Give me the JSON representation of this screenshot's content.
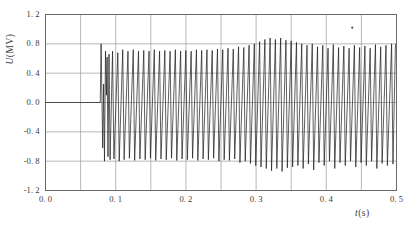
{
  "chart_data": {
    "type": "line",
    "title": "",
    "xlabel": "t(s)",
    "ylabel": "U(MV)",
    "xlabel_symbol": "t",
    "xlabel_unit": "(s)",
    "ylabel_symbol": "U",
    "ylabel_unit": "(MV)",
    "xlim": [
      0.0,
      0.5
    ],
    "ylim": [
      -1.2,
      1.2
    ],
    "xticks": [
      0.0,
      0.1,
      0.2,
      0.3,
      0.4,
      0.5
    ],
    "xticklabels": [
      "0. 0",
      "0. 1",
      "0. 2",
      "0. 3",
      "0. 4",
      "0. 5"
    ],
    "yticks": [
      1.2,
      0.8,
      0.4,
      0.0,
      -0.4,
      -0.8,
      -1.2
    ],
    "yticklabels": [
      "1. 2",
      "0. 8",
      "0. 4",
      "0. 0",
      "-0. 4",
      "-0. 8",
      "-1. 2"
    ],
    "x_minor_step": 0.05,
    "grid": true,
    "grid_color": "#9a9a9a",
    "line_color": "#1a1a1a",
    "line_width": 0.7,
    "frame_color": "#6a6a6a",
    "background": "#ffffff",
    "series": [
      {
        "name": "U(t)",
        "points": [
          [
            0.0,
            0.0
          ],
          [
            0.078,
            0.0
          ],
          [
            0.0792,
            0.8
          ],
          [
            0.0815,
            -0.62
          ],
          [
            0.0828,
            0.25
          ],
          [
            0.084,
            -0.8
          ],
          [
            0.0855,
            0.7
          ],
          [
            0.0868,
            0.1
          ],
          [
            0.0878,
            0.62
          ],
          [
            0.089,
            -0.74
          ],
          [
            0.0905,
            0.66
          ],
          [
            0.092,
            -0.78
          ],
          [
            0.0955,
            0.7
          ],
          [
            0.0975,
            -0.77
          ],
          [
            0.103,
            0.68
          ],
          [
            0.105,
            -0.8
          ],
          [
            0.11,
            0.72
          ],
          [
            0.112,
            -0.78
          ],
          [
            0.1175,
            0.7
          ],
          [
            0.1195,
            -0.76
          ],
          [
            0.125,
            0.72
          ],
          [
            0.127,
            -0.79
          ],
          [
            0.1325,
            0.7
          ],
          [
            0.1345,
            -0.77
          ],
          [
            0.14,
            0.71
          ],
          [
            0.142,
            -0.78
          ],
          [
            0.1475,
            0.7
          ],
          [
            0.1495,
            -0.76
          ],
          [
            0.155,
            0.72
          ],
          [
            0.157,
            -0.79
          ],
          [
            0.1625,
            0.7
          ],
          [
            0.1645,
            -0.77
          ],
          [
            0.17,
            0.71
          ],
          [
            0.172,
            -0.78
          ],
          [
            0.1775,
            0.7
          ],
          [
            0.1795,
            -0.76
          ],
          [
            0.185,
            0.72
          ],
          [
            0.187,
            -0.79
          ],
          [
            0.1925,
            0.7
          ],
          [
            0.1945,
            -0.77
          ],
          [
            0.2,
            0.71
          ],
          [
            0.202,
            -0.78
          ],
          [
            0.2075,
            0.7
          ],
          [
            0.2095,
            -0.76
          ],
          [
            0.215,
            0.72
          ],
          [
            0.217,
            -0.79
          ],
          [
            0.2225,
            0.71
          ],
          [
            0.2245,
            -0.77
          ],
          [
            0.23,
            0.72
          ],
          [
            0.232,
            -0.78
          ],
          [
            0.2375,
            0.71
          ],
          [
            0.2395,
            -0.76
          ],
          [
            0.245,
            0.73
          ],
          [
            0.247,
            -0.8
          ],
          [
            0.2525,
            0.72
          ],
          [
            0.2545,
            -0.78
          ],
          [
            0.26,
            0.74
          ],
          [
            0.262,
            -0.79
          ],
          [
            0.2675,
            0.73
          ],
          [
            0.2695,
            -0.77
          ],
          [
            0.275,
            0.76
          ],
          [
            0.277,
            -0.82
          ],
          [
            0.2825,
            0.75
          ],
          [
            0.2845,
            -0.8
          ],
          [
            0.29,
            0.78
          ],
          [
            0.292,
            -0.83
          ],
          [
            0.2975,
            0.8
          ],
          [
            0.2995,
            -0.86
          ],
          [
            0.305,
            0.83
          ],
          [
            0.307,
            -0.88
          ],
          [
            0.3125,
            0.86
          ],
          [
            0.3145,
            -0.9
          ],
          [
            0.32,
            0.88
          ],
          [
            0.322,
            -0.93
          ],
          [
            0.3275,
            0.86
          ],
          [
            0.3295,
            -0.9
          ],
          [
            0.335,
            0.88
          ],
          [
            0.337,
            -0.94
          ],
          [
            0.3425,
            0.85
          ],
          [
            0.3445,
            -0.89
          ],
          [
            0.35,
            0.84
          ],
          [
            0.352,
            -0.88
          ],
          [
            0.3575,
            0.82
          ],
          [
            0.3595,
            -0.86
          ],
          [
            0.365,
            0.8
          ],
          [
            0.367,
            -0.9
          ],
          [
            0.3725,
            0.78
          ],
          [
            0.3745,
            -0.84
          ],
          [
            0.38,
            0.8
          ],
          [
            0.382,
            -0.92
          ],
          [
            0.3875,
            0.76
          ],
          [
            0.3895,
            -0.82
          ],
          [
            0.395,
            0.78
          ],
          [
            0.397,
            -0.86
          ],
          [
            0.4025,
            0.74
          ],
          [
            0.4045,
            -0.8
          ],
          [
            0.41,
            0.79
          ],
          [
            0.412,
            -0.9
          ],
          [
            0.4175,
            0.75
          ],
          [
            0.4195,
            -0.82
          ],
          [
            0.425,
            0.77
          ],
          [
            0.427,
            -0.86
          ],
          [
            0.4325,
            0.74
          ],
          [
            0.4345,
            -0.8
          ],
          [
            0.44,
            0.78
          ],
          [
            0.442,
            -0.88
          ],
          [
            0.4475,
            0.75
          ],
          [
            0.4495,
            -0.82
          ],
          [
            0.455,
            0.77
          ],
          [
            0.457,
            -0.86
          ],
          [
            0.4625,
            0.74
          ],
          [
            0.4645,
            -0.8
          ],
          [
            0.47,
            0.79
          ],
          [
            0.472,
            -0.9
          ],
          [
            0.4775,
            0.76
          ],
          [
            0.4795,
            -0.83
          ],
          [
            0.485,
            0.78
          ],
          [
            0.487,
            -0.86
          ],
          [
            0.493,
            0.8
          ],
          [
            0.495,
            -0.84
          ],
          [
            0.4985,
            0.8
          ]
        ]
      }
    ],
    "artifacts": [
      {
        "name": "speck",
        "x": 0.437,
        "y": 1.02
      }
    ]
  }
}
